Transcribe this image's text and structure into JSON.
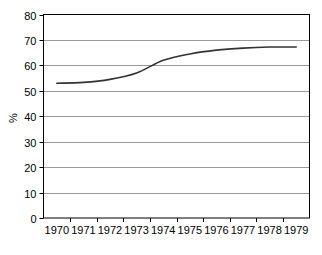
{
  "chart_data": {
    "type": "line",
    "title": "",
    "subtitle": "",
    "xlabel": "",
    "ylabel": "%",
    "categories": [
      "1970",
      "1971",
      "1972",
      "1973",
      "1974",
      "1975",
      "1976",
      "1977",
      "1978",
      "1979"
    ],
    "values": [
      53,
      53.3,
      54.5,
      57,
      62,
      64.5,
      66,
      66.8,
      67.2,
      67.2
    ],
    "series": [
      {
        "name": "",
        "values": [
          53,
          53.3,
          54.5,
          57,
          62,
          64.5,
          66,
          66.8,
          67.2,
          67.2
        ]
      }
    ],
    "ylim": [
      0,
      80
    ],
    "ytick_step": 10,
    "yticks": [
      "0",
      "10",
      "20",
      "30",
      "40",
      "50",
      "60",
      "70",
      "80"
    ],
    "grid": "horizontal",
    "legend": "none",
    "annotations": []
  },
  "style": {
    "line_color": "#333333",
    "grid_color": "#999999",
    "axis_color": "#000000",
    "background": "#ffffff",
    "text_color": "#000000"
  }
}
